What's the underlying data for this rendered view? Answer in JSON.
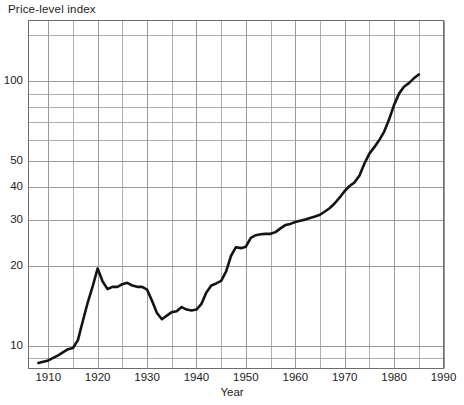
{
  "figure": {
    "title": "Price-level index",
    "xaxis_title": "Year"
  },
  "chart_data": {
    "type": "line",
    "title": "Price-level index",
    "xlabel": "Year",
    "ylabel": "Price-level index",
    "yscale": "log",
    "xlim": [
      1906,
      1990
    ],
    "ylim": [
      8.2,
      170
    ],
    "grid": true,
    "legend": false,
    "ytick_labels": [
      "10",
      "20",
      "30",
      "40",
      "50",
      "100"
    ],
    "ytick_values": [
      10,
      20,
      30,
      40,
      50,
      100
    ],
    "minor_gridlines_y": [
      9,
      10,
      20,
      30,
      40,
      50,
      60,
      70,
      80,
      90,
      100,
      150
    ],
    "xtick_labels": [
      "1910",
      "1920",
      "1930",
      "1940",
      "1950",
      "1960",
      "1970",
      "1980",
      "1990"
    ],
    "xtick_values": [
      1910,
      1920,
      1930,
      1940,
      1950,
      1960,
      1970,
      1980,
      1990
    ],
    "minor_gridlines_x": [
      1910,
      1915,
      1920,
      1925,
      1930,
      1935,
      1940,
      1945,
      1950,
      1955,
      1960,
      1965,
      1970,
      1975,
      1980,
      1985,
      1990
    ],
    "line_color": "#141414",
    "line_width": 2.6,
    "grid_color": "#9a9a9a",
    "series": [
      {
        "name": "Price-level index",
        "x": [
          1908,
          1910,
          1912,
          1914,
          1915,
          1916,
          1917,
          1918,
          1919,
          1920,
          1921,
          1922,
          1923,
          1924,
          1925,
          1926,
          1927,
          1928,
          1929,
          1930,
          1931,
          1932,
          1933,
          1934,
          1935,
          1936,
          1937,
          1938,
          1939,
          1940,
          1941,
          1942,
          1943,
          1944,
          1945,
          1946,
          1947,
          1948,
          1949,
          1950,
          1951,
          1952,
          1953,
          1954,
          1955,
          1956,
          1957,
          1958,
          1959,
          1960,
          1961,
          1962,
          1963,
          1964,
          1965,
          1966,
          1967,
          1968,
          1969,
          1970,
          1971,
          1972,
          1973,
          1974,
          1975,
          1976,
          1977,
          1978,
          1979,
          1980,
          1981,
          1982,
          1983,
          1984,
          1985
        ],
        "y": [
          8.6,
          8.8,
          9.2,
          9.7,
          9.8,
          10.5,
          12.4,
          14.6,
          16.8,
          19.6,
          17.5,
          16.4,
          16.7,
          16.7,
          17.1,
          17.3,
          16.9,
          16.7,
          16.7,
          16.3,
          14.8,
          13.3,
          12.6,
          13.0,
          13.4,
          13.5,
          14.0,
          13.7,
          13.6,
          13.7,
          14.4,
          15.9,
          16.9,
          17.2,
          17.6,
          19.1,
          21.9,
          23.6,
          23.4,
          23.7,
          25.6,
          26.2,
          26.4,
          26.5,
          26.5,
          26.9,
          27.8,
          28.6,
          28.9,
          29.4,
          29.7,
          30.0,
          30.4,
          30.8,
          31.3,
          32.2,
          33.2,
          34.6,
          36.4,
          38.5,
          40.2,
          41.5,
          44.1,
          48.9,
          53.3,
          56.4,
          60.0,
          64.6,
          71.9,
          81.5,
          89.9,
          95.4,
          98.5,
          102.7,
          106.3
        ]
      }
    ]
  }
}
